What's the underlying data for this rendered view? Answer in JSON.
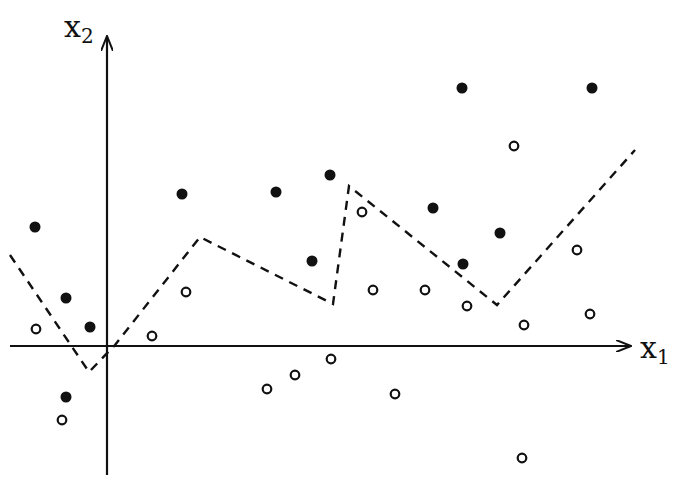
{
  "figure": {
    "axis_labels": {
      "x1": {
        "base": "x",
        "sub": "1"
      },
      "x2": {
        "base": "x",
        "sub": "2"
      }
    },
    "colors": {
      "ink": "#111111",
      "background": "#ffffff"
    }
  },
  "chart_data": {
    "type": "scatter",
    "title": "",
    "xlabel": "x1",
    "ylabel": "x2",
    "grid": false,
    "legend": null,
    "origin_px": [
      107,
      346
    ],
    "series": [
      {
        "name": "class-filled",
        "marker": "filled-circle",
        "points_px": [
          [
            35,
            227
          ],
          [
            66,
            298
          ],
          [
            90,
            327
          ],
          [
            66,
            397
          ],
          [
            182,
            194
          ],
          [
            276,
            192
          ],
          [
            330,
            175
          ],
          [
            312,
            261
          ],
          [
            433,
            208
          ],
          [
            462,
            88
          ],
          [
            592,
            88
          ],
          [
            500,
            233
          ],
          [
            463,
            264
          ]
        ]
      },
      {
        "name": "class-open",
        "marker": "open-circle",
        "points_px": [
          [
            36,
            329
          ],
          [
            62,
            420
          ],
          [
            152,
            336
          ],
          [
            186,
            292
          ],
          [
            362,
            212
          ],
          [
            373,
            290
          ],
          [
            425,
            290
          ],
          [
            467,
            306
          ],
          [
            524,
            325
          ],
          [
            577,
            250
          ],
          [
            590,
            314
          ],
          [
            514,
            146
          ],
          [
            331,
            359
          ],
          [
            295,
            375
          ],
          [
            267,
            389
          ],
          [
            395,
            394
          ],
          [
            522,
            458
          ]
        ]
      }
    ],
    "boundary": {
      "style": "dashed",
      "vertices_px": [
        [
          10,
          255
        ],
        [
          89,
          372
        ],
        [
          115,
          345
        ],
        [
          200,
          237
        ],
        [
          333,
          304
        ],
        [
          349,
          186
        ],
        [
          497,
          305
        ],
        [
          635,
          150
        ]
      ]
    }
  }
}
